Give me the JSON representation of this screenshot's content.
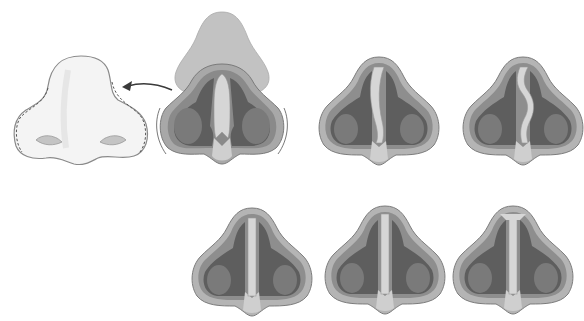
{
  "diagram": {
    "title": "",
    "colors": {
      "background": "#ffffff",
      "skin_light": "#f2f2f2",
      "skin_outline": "#8a8a8a",
      "soft_tissue": "#b9b9b9",
      "outer_layer": "#a6a6a6",
      "cartilage": "#d6d6d6",
      "cavity_dark": "#5e5e5e",
      "turbinate": "#7a7a7a",
      "arrow": "#3a3a3a"
    },
    "panels": [
      {
        "id": "external-nose",
        "label": "external nose (skin envelope removed)",
        "row": 1,
        "col": 1
      },
      {
        "id": "dissected-nose",
        "label": "nose with skin lifted, septum visible",
        "row": 1,
        "col": 2
      },
      {
        "id": "septum-deviated-c",
        "label": "C-shaped septal deviation",
        "row": 1,
        "col": 3
      },
      {
        "id": "septum-deviated-s",
        "label": "S-shaped septal deviation",
        "row": 1,
        "col": 4
      },
      {
        "id": "septum-straight-1",
        "label": "straight septum",
        "row": 2,
        "col": 1
      },
      {
        "id": "septum-straight-2",
        "label": "straight septum variant",
        "row": 2,
        "col": 2
      },
      {
        "id": "septum-straight-3",
        "label": "straight septum variant",
        "row": 2,
        "col": 3
      }
    ],
    "arrow": {
      "from": "dissected-nose",
      "to": "external-nose",
      "direction": "left"
    }
  }
}
